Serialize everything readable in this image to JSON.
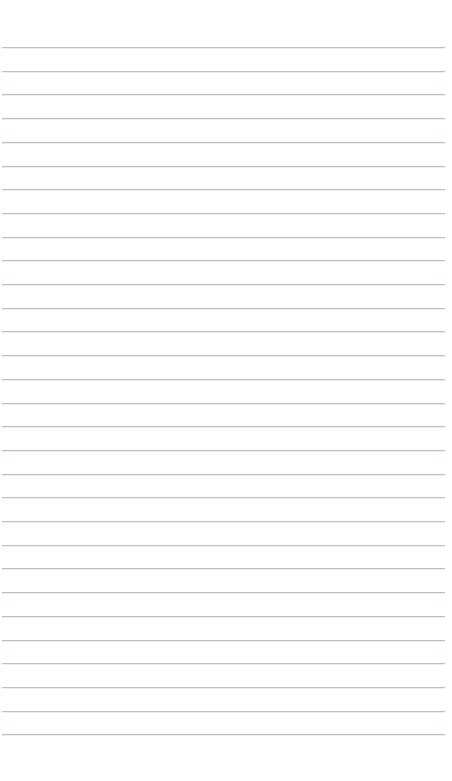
{
  "document": {
    "kind": "ruled-paper",
    "title": "",
    "page_label": "",
    "background_color": "#ffffff",
    "rule_color": "#b9bdc1",
    "width_px": 452,
    "height_px": 781
  },
  "ruling": {
    "line_count": 30,
    "first_line_y": 47,
    "line_spacing_px": 23.7,
    "line_thickness_px": 1,
    "line_start_x": 2,
    "line_end_x": 445,
    "top_margin_px": 47,
    "bottom_margin_px": 54,
    "left_margin_px": 2,
    "right_margin_px": 7,
    "has_vertical_margin_rule": false,
    "has_header_rule": false
  },
  "content": {
    "is_blank": true,
    "text_lines": [
      "",
      "",
      "",
      "",
      "",
      "",
      "",
      "",
      "",
      "",
      "",
      "",
      "",
      "",
      "",
      "",
      "",
      "",
      "",
      "",
      "",
      "",
      "",
      "",
      "",
      "",
      "",
      "",
      "",
      ""
    ]
  }
}
